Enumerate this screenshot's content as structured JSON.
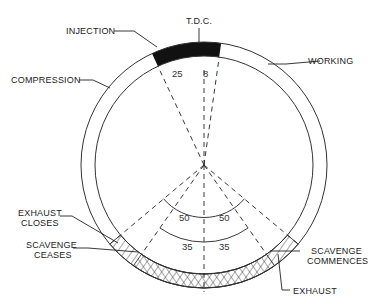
{
  "diagram": {
    "type": "two-stroke engine timing diagram",
    "labels": {
      "tdc": "T.D.C.",
      "injection": "INJECTION",
      "compression": "COMPRESSION",
      "working": "WORKING",
      "exhaust_closes_line1": "EXHAUST",
      "exhaust_closes_line2": "CLOSES",
      "scavenge_ceases_line1": "SCAVENGE",
      "scavenge_ceases_line2": "CEASES",
      "scavenge_commences_line1": "SCAVENGE",
      "scavenge_commences_line2": "COMMENCES",
      "exhaust": "EXHAUST"
    },
    "angles": {
      "injection_before_tdc": "25",
      "injection_after_tdc": "8",
      "exhaust_left": "50",
      "exhaust_right": "50",
      "scavenge_left": "35",
      "scavenge_right": "35"
    },
    "colors": {
      "line": "#222222",
      "injection_fill": "#111111",
      "background": "#ffffff"
    }
  }
}
